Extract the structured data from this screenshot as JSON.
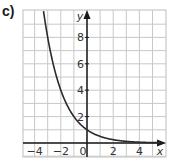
{
  "part_label": "c)",
  "chart_data": {
    "type": "line",
    "title": "",
    "xlabel": "x",
    "ylabel": "y",
    "function": "y = (1/2)^x",
    "xlim": [
      -4.9,
      6.0
    ],
    "ylim": [
      -1.1,
      10.0
    ],
    "grid": true,
    "x_ticks": [
      -4,
      -2,
      0,
      2,
      4
    ],
    "y_ticks": [
      2,
      4,
      6,
      8
    ],
    "x_tick_labels": [
      "-4",
      "-2",
      "0",
      "2",
      "4"
    ],
    "y_tick_labels": [
      "2",
      "4",
      "6",
      "8"
    ],
    "series": [
      {
        "name": "curve",
        "x": [
          -3.3,
          -3,
          -2.5,
          -2,
          -1.5,
          -1,
          -0.5,
          0,
          0.5,
          1,
          1.5,
          2,
          3,
          4,
          5
        ],
        "values": [
          9.85,
          8,
          5.66,
          4,
          2.83,
          2,
          1.41,
          1,
          0.71,
          0.5,
          0.35,
          0.25,
          0.125,
          0.0625,
          0.031
        ]
      }
    ],
    "colors": {
      "grid": "#c8c8c8",
      "axis": "#1a1a1a",
      "curve": "#2a2a2a"
    }
  }
}
